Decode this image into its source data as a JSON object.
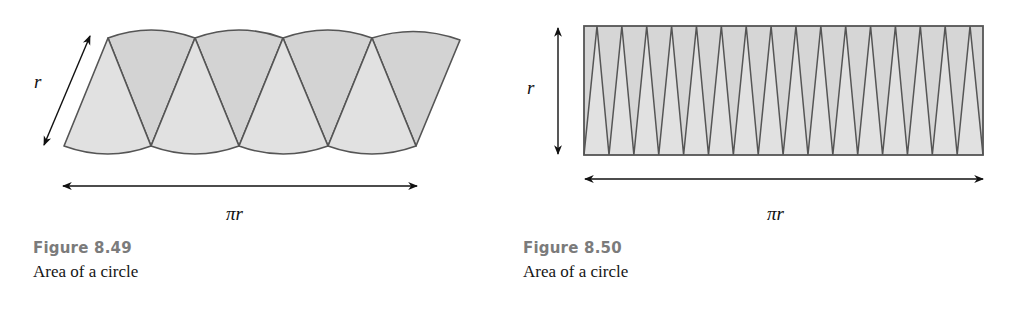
{
  "figures": [
    {
      "id": "8.49",
      "number_label": "Figure 8.49",
      "caption": "Area of a circle",
      "side_label": "r",
      "bottom_label": "πr",
      "description": "Circle cut into 8 sectors rearranged alternately into an approximate parallelogram",
      "sector_count": 8,
      "colors": {
        "up_sector": "#e1e1e1",
        "down_sector": "#d3d3d3",
        "stroke": "#555555"
      }
    },
    {
      "id": "8.50",
      "number_label": "Figure 8.50",
      "caption": "Area of a circle",
      "side_label": "r",
      "bottom_label": "πr",
      "description": "Circle cut into many thin sectors rearranged into an approximate rectangle of height r and width πr",
      "sector_count": 32,
      "colors": {
        "up_sector": "#e1e1e1",
        "down_sector": "#d3d3d3",
        "stroke": "#555555"
      }
    }
  ]
}
